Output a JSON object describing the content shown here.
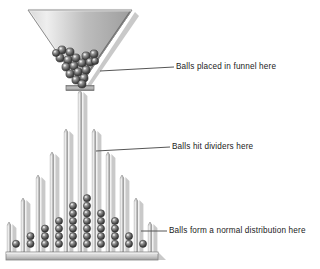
{
  "figure": {
    "background": "#ffffff",
    "ink": "#1b1b1b"
  },
  "colors": {
    "metal_light": "#f2f2f2",
    "metal_mid": "#b9b9b9",
    "metal_dark": "#8a8a8a",
    "ball_light": "#c9c9c9",
    "ball_dark": "#3a3a3a",
    "shadow": "#c6c6c6",
    "leader_line": "#555555",
    "text": "#1b1b1b"
  },
  "annotations": [
    {
      "id": "funnel",
      "text": "Balls placed in funnel here",
      "leader_from": {
        "x": 100,
        "y": 71
      },
      "leader_to": {
        "x": 174,
        "y": 67
      }
    },
    {
      "id": "dividers",
      "text": "Balls hit dividers here",
      "leader_from": {
        "x": 96,
        "y": 151
      },
      "leader_to": {
        "x": 170,
        "y": 147
      }
    },
    {
      "id": "distribution",
      "text": "Balls form a normal distribution here",
      "leader_from": {
        "x": 141,
        "y": 231
      },
      "leader_to": {
        "x": 167,
        "y": 231
      }
    }
  ],
  "funnel": {
    "label": "funnel",
    "top_left_x": 28,
    "top_right_x": 132,
    "top_y": 10,
    "apex_x": 80,
    "apex_y": 86,
    "spout": {
      "x": 66,
      "y": 86,
      "width": 28,
      "height": 5
    },
    "ball_count": 19,
    "balls": [
      {
        "cx": 62,
        "cy": 50,
        "r": 4.1
      },
      {
        "cx": 70,
        "cy": 52,
        "r": 4.1
      },
      {
        "cx": 60,
        "cy": 58,
        "r": 4.1
      },
      {
        "cx": 68,
        "cy": 60,
        "r": 4.1
      },
      {
        "cx": 76,
        "cy": 58,
        "r": 4.1
      },
      {
        "cx": 86,
        "cy": 56,
        "r": 4.1
      },
      {
        "cx": 94,
        "cy": 54,
        "r": 4.1
      },
      {
        "cx": 66,
        "cy": 67,
        "r": 4.1
      },
      {
        "cx": 74,
        "cy": 66,
        "r": 4.1
      },
      {
        "cx": 82,
        "cy": 63,
        "r": 4.1
      },
      {
        "cx": 90,
        "cy": 62,
        "r": 4.1
      },
      {
        "cx": 70,
        "cy": 74,
        "r": 4.1
      },
      {
        "cx": 78,
        "cy": 72,
        "r": 4.1
      },
      {
        "cx": 86,
        "cy": 70,
        "r": 4.1
      },
      {
        "cx": 76,
        "cy": 80,
        "r": 4.1
      },
      {
        "cx": 84,
        "cy": 78,
        "r": 4.1
      },
      {
        "cx": 82,
        "cy": 84,
        "r": 4.1
      },
      {
        "cx": 56,
        "cy": 53,
        "r": 3.6
      },
      {
        "cx": 95,
        "cy": 61,
        "r": 3.6
      }
    ]
  },
  "board": {
    "floor": {
      "x": 6,
      "y": 252,
      "width": 152,
      "height": 8
    },
    "divider_count": 11,
    "bin_count": 10,
    "dividers": [
      {
        "index": 0,
        "x": 9,
        "top_y": 222,
        "width": 3.4
      },
      {
        "index": 1,
        "x": 23,
        "top_y": 198,
        "width": 3.4
      },
      {
        "index": 2,
        "x": 38,
        "top_y": 175,
        "width": 3.4
      },
      {
        "index": 3,
        "x": 52,
        "top_y": 152,
        "width": 3.4
      },
      {
        "index": 4,
        "x": 66,
        "top_y": 129,
        "width": 3.4
      },
      {
        "index": 5,
        "x": 80,
        "top_y": 90,
        "width": 3.4
      },
      {
        "index": 6,
        "x": 94,
        "top_y": 129,
        "width": 3.4
      },
      {
        "index": 7,
        "x": 108,
        "top_y": 152,
        "width": 3.4
      },
      {
        "index": 8,
        "x": 122,
        "top_y": 175,
        "width": 3.4
      },
      {
        "index": 9,
        "x": 136,
        "top_y": 198,
        "width": 3.4
      },
      {
        "index": 10,
        "x": 150,
        "top_y": 222,
        "width": 3.4
      }
    ]
  },
  "chart_data": {
    "type": "bar",
    "title": "Balls form a normal distribution here",
    "xlabel": "Bin",
    "ylabel": "Number of balls",
    "categories": [
      "1",
      "2",
      "3",
      "4",
      "5",
      "6",
      "7",
      "8",
      "9",
      "10"
    ],
    "values": [
      1,
      2,
      3,
      4,
      6,
      7,
      5,
      4,
      2,
      1
    ],
    "ylim": [
      0,
      8
    ],
    "grid": false,
    "legend": "none",
    "total_balls": 35,
    "ball_radius": 3.6,
    "ball_pitch": 7.6,
    "bin_base_y": 248,
    "bin_centers_x": [
      16,
      30.5,
      45,
      59,
      73,
      87,
      101,
      115,
      129,
      143
    ]
  }
}
